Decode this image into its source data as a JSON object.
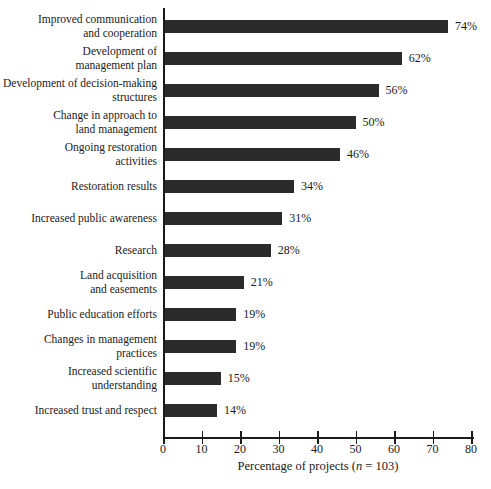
{
  "chart_data": {
    "type": "bar",
    "orientation": "horizontal",
    "categories": [
      [
        "Improved communication",
        "and cooperation"
      ],
      [
        "Development of",
        "management plan"
      ],
      [
        "Development of decision-making",
        "structures"
      ],
      [
        "Change in approach to",
        "land management"
      ],
      [
        "Ongoing restoration",
        "activities"
      ],
      [
        "Restoration results"
      ],
      [
        "Increased public awareness"
      ],
      [
        "Research"
      ],
      [
        "Land acquisition",
        "and easements"
      ],
      [
        "Public education efforts"
      ],
      [
        "Changes in management",
        "practices"
      ],
      [
        "Increased scientific",
        "understanding"
      ],
      [
        "Increased trust and respect"
      ]
    ],
    "values": [
      74,
      62,
      56,
      50,
      46,
      34,
      31,
      28,
      21,
      19,
      19,
      15,
      14
    ],
    "value_labels": [
      "74%",
      "62%",
      "56%",
      "50%",
      "46%",
      "34%",
      "31%",
      "28%",
      "21%",
      "19%",
      "19%",
      "15%",
      "14%"
    ],
    "xlim": [
      0,
      80
    ],
    "xticks": [
      0,
      10,
      20,
      30,
      40,
      50,
      60,
      70,
      80
    ],
    "xtick_labels": [
      "0",
      "10",
      "20",
      "30",
      "40",
      "50",
      "60",
      "70",
      "80"
    ],
    "xlabel": "Percentage of projects (n = 103)",
    "xlabel_parts": {
      "prefix": "Percentage of projects (",
      "italic": "n",
      "suffix": " = 103)"
    },
    "grid": false,
    "legend": "none",
    "colors": {
      "bar": "#2b2b2b",
      "axis": "#1a1a1a",
      "text": "#1a1a1a",
      "background": "#ffffff"
    }
  }
}
